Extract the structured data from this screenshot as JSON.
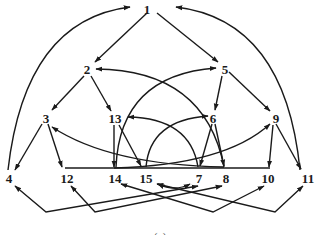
{
  "diagram": {
    "type": "directed-graph",
    "caption": "(a)",
    "colors": {
      "stroke": "#1a1a1a",
      "background": "#ffffff"
    },
    "nodes": [
      {
        "id": "1",
        "label": "1"
      },
      {
        "id": "2",
        "label": "2"
      },
      {
        "id": "5",
        "label": "5"
      },
      {
        "id": "3",
        "label": "3"
      },
      {
        "id": "13",
        "label": "13"
      },
      {
        "id": "6",
        "label": "6"
      },
      {
        "id": "9",
        "label": "9"
      },
      {
        "id": "4",
        "label": "4"
      },
      {
        "id": "12",
        "label": "12"
      },
      {
        "id": "14",
        "label": "14"
      },
      {
        "id": "15",
        "label": "15"
      },
      {
        "id": "7",
        "label": "7"
      },
      {
        "id": "8",
        "label": "8"
      },
      {
        "id": "10",
        "label": "10"
      },
      {
        "id": "11",
        "label": "11"
      }
    ],
    "edges": [
      {
        "from": "1",
        "to": "2"
      },
      {
        "from": "1",
        "to": "5"
      },
      {
        "from": "4",
        "to": "1"
      },
      {
        "from": "11",
        "to": "1"
      },
      {
        "from": "2",
        "to": "3"
      },
      {
        "from": "2",
        "to": "13"
      },
      {
        "from": "5",
        "to": "6"
      },
      {
        "from": "5",
        "to": "9"
      },
      {
        "from": "8",
        "to": "2"
      },
      {
        "from": "14",
        "to": "5"
      },
      {
        "from": "3",
        "to": "4"
      },
      {
        "from": "3",
        "to": "12"
      },
      {
        "from": "13",
        "to": "14"
      },
      {
        "from": "13",
        "to": "15"
      },
      {
        "from": "7",
        "to": "13"
      },
      {
        "from": "15",
        "to": "6"
      },
      {
        "from": "6",
        "to": "7"
      },
      {
        "from": "6",
        "to": "8"
      },
      {
        "from": "9",
        "to": "10"
      },
      {
        "from": "9",
        "to": "11"
      },
      {
        "from": "8",
        "to": "3"
      },
      {
        "from": "14",
        "to": "9"
      },
      {
        "from": "7",
        "to": "4"
      },
      {
        "from": "8",
        "to": "12"
      },
      {
        "from": "14",
        "to": "10"
      },
      {
        "from": "15",
        "to": "11"
      },
      {
        "from": "15",
        "to": "7"
      },
      {
        "from": "12",
        "to": "8"
      }
    ]
  }
}
